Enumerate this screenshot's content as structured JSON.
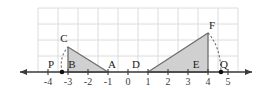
{
  "figure": {
    "colors": {
      "grid": "#d8d8d8",
      "axis": "#3a3a3a",
      "triangle_stroke": "#6e6e6e",
      "triangle_fill": "#d0d0d0",
      "segment": "#8a8a8a",
      "point": "#111111",
      "dash": "#6e6e6e",
      "label": "#1a1a1a",
      "background": "#ffffff"
    },
    "axis": {
      "name": "x-axis",
      "min": -4.6,
      "max": 5.6,
      "unit_px": 20,
      "origin_px": {
        "x": 128,
        "y": 72
      },
      "tick_labels": [
        "-4",
        "-3",
        "-2",
        "-1",
        "0",
        "1",
        "2",
        "3",
        "4",
        "5"
      ],
      "tick_values": [
        -4,
        -3,
        -2,
        -1,
        0,
        1,
        2,
        3,
        4,
        5
      ],
      "arrow_left": true,
      "arrow_right": true
    },
    "grid": {
      "visible": true,
      "x_from": -4.5,
      "x_to": 5.5,
      "y_rows": 4,
      "row_height_px": 16
    },
    "points": [
      {
        "label": "P",
        "x": -3.3,
        "y": 0,
        "marker": true,
        "label_dx": -11,
        "label_dy": -4
      },
      {
        "label": "B",
        "x": -3.0,
        "y": 0,
        "marker": false,
        "label_dx": 4,
        "label_dy": -4
      },
      {
        "label": "A",
        "x": -1.0,
        "y": 0,
        "marker": false,
        "label_dx": 4,
        "label_dy": -4
      },
      {
        "label": "C",
        "x": -3.0,
        "y": 1.25,
        "marker": false,
        "label_dx": -4,
        "label_dy": -5
      },
      {
        "label": "D",
        "x": 1.0,
        "y": 0,
        "marker": false,
        "label_dx": -12,
        "label_dy": -4
      },
      {
        "label": "E",
        "x": 4.0,
        "y": 0,
        "marker": false,
        "label_dx": -12,
        "label_dy": -4
      },
      {
        "label": "F",
        "x": 4.0,
        "y": 1.95,
        "marker": false,
        "label_dx": 4,
        "label_dy": -4
      },
      {
        "label": "Q",
        "x": 4.65,
        "y": 0,
        "marker": true,
        "label_dx": 3,
        "label_dy": -4
      }
    ],
    "triangles": [
      {
        "name": "triangle-BCA",
        "vertices": [
          [
            -3,
            0
          ],
          [
            -3,
            1.25
          ],
          [
            -1,
            0
          ]
        ],
        "filled": true
      },
      {
        "name": "triangle-DFE",
        "vertices": [
          [
            1,
            0
          ],
          [
            4,
            1.95
          ],
          [
            4,
            0
          ]
        ],
        "filled": true
      }
    ],
    "segments": [
      {
        "name": "segment-BA",
        "from": [
          -3,
          0
        ],
        "to": [
          -1,
          0
        ]
      },
      {
        "name": "segment-DE",
        "from": [
          1,
          0
        ],
        "to": [
          4,
          0
        ]
      }
    ],
    "arcs": [
      {
        "name": "arc-PC",
        "from": [
          -3.3,
          0
        ],
        "to": [
          -3,
          1.25
        ],
        "control": [
          -3.45,
          0.75
        ],
        "style": "dashed"
      },
      {
        "name": "arc-FQ",
        "from": [
          4,
          1.95
        ],
        "to": [
          4.65,
          0
        ],
        "control": [
          4.62,
          1.3
        ],
        "style": "dashed"
      }
    ]
  }
}
